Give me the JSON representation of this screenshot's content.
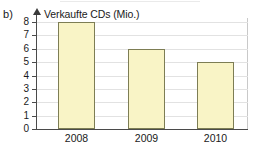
{
  "figure": {
    "part_label": "b)",
    "axis_title": "Verkaufte CDs (Mio.)"
  },
  "colors": {
    "bar_fill": "#f9f4c6",
    "bar_border": "#7d7d54",
    "axis": "#4a4a4a",
    "gridline": "#e2e2e2",
    "text": "#1a1a1a",
    "background": "#ffffff"
  },
  "chart_data": {
    "type": "bar",
    "title": "Verkaufte CDs (Mio.)",
    "xlabel": "",
    "ylabel": "Verkaufte CDs (Mio.)",
    "categories": [
      "2008",
      "2009",
      "2010"
    ],
    "values": [
      8,
      6,
      5
    ],
    "ylim": [
      0,
      8
    ],
    "yticks": [
      0,
      1,
      2,
      3,
      4,
      5,
      6,
      7,
      8
    ],
    "ytick_labels": [
      "0",
      "1",
      "2",
      "3",
      "4",
      "5",
      "6",
      "7",
      "8"
    ],
    "grid": true,
    "legend": null,
    "series": [
      {
        "name": "Verkaufte CDs (Mio.)",
        "values": [
          8,
          6,
          5
        ]
      }
    ]
  }
}
